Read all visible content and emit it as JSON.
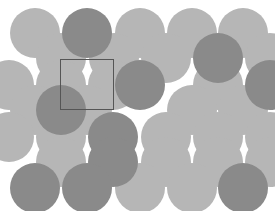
{
  "figure": {
    "width": 275,
    "height": 211,
    "background_color": "#ffffff"
  },
  "legend": {
    "light_atom_label": "light sphere",
    "dark_atom_label": "dark sphere",
    "unit_cell_label": "unit cell"
  },
  "colors": {
    "light": "#b6b6b6",
    "dark": "#8a8a8a",
    "unit_cell_stroke": "#555555",
    "background": "#ffffff"
  },
  "chart_data": {
    "type": "scatter",
    "xlabel": "",
    "ylabel": "",
    "xlim": [
      0,
      275
    ],
    "ylim": [
      0,
      211
    ],
    "grid": false,
    "legend_position": "none",
    "marker": "circle",
    "radius": 25,
    "row_spacing": 26,
    "column_spacing": 52,
    "series": [
      {
        "name": "light",
        "color": "#b6b6b6",
        "points": [
          [
            35,
            33
          ],
          [
            140,
            33
          ],
          [
            192,
            33
          ],
          [
            243,
            33
          ],
          [
            61,
            58
          ],
          [
            114,
            58
          ],
          [
            166,
            58
          ],
          [
            270,
            58
          ],
          [
            9,
            85
          ],
          [
            61,
            85
          ],
          [
            113,
            85
          ],
          [
            218,
            85
          ],
          [
            35,
            110
          ],
          [
            87,
            110
          ],
          [
            192,
            110
          ],
          [
            243,
            110
          ],
          [
            9,
            137
          ],
          [
            61,
            137
          ],
          [
            166,
            137
          ],
          [
            218,
            137
          ],
          [
            270,
            137
          ],
          [
            61,
            162
          ],
          [
            166,
            162
          ],
          [
            218,
            162
          ],
          [
            270,
            162
          ],
          [
            140,
            188
          ],
          [
            192,
            188
          ]
        ]
      },
      {
        "name": "dark",
        "color": "#8a8a8a",
        "points": [
          [
            87,
            33
          ],
          [
            218,
            58
          ],
          [
            140,
            85
          ],
          [
            270,
            85
          ],
          [
            61,
            110
          ],
          [
            113,
            137
          ],
          [
            113,
            162
          ],
          [
            35,
            188
          ],
          [
            87,
            188
          ],
          [
            243,
            188
          ]
        ]
      }
    ],
    "annotations": [
      {
        "type": "rect",
        "name": "unit-cell",
        "x": 60,
        "y": 59,
        "width": 54,
        "height": 51,
        "stroke": "#555555",
        "stroke_width": 1.5,
        "fill": "none"
      }
    ]
  }
}
